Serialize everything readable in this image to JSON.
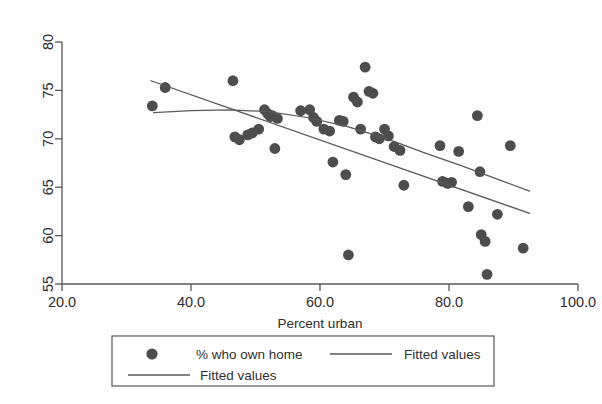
{
  "chart_data": {
    "type": "scatter",
    "title": "",
    "xlabel": "Percent urban",
    "ylabel": "",
    "xlim": [
      20.0,
      100.0
    ],
    "ylim": [
      55,
      80
    ],
    "xticks": [
      "20.0",
      "40.0",
      "60.0",
      "80.0",
      "100.0"
    ],
    "xtick_values": [
      20.0,
      40.0,
      60.0,
      80.0,
      100.0
    ],
    "yticks": [
      "55",
      "60",
      "65",
      "70",
      "75",
      "80"
    ],
    "ytick_values": [
      55,
      60,
      65,
      70,
      75,
      80
    ],
    "grid": false,
    "legend_position": "below-plot",
    "marker_color": "#4d4d4d",
    "line_color": "#5a5a5a",
    "series": [
      {
        "name": "% who own home",
        "kind": "scatter",
        "points": [
          [
            34.0,
            73.4
          ],
          [
            36.0,
            75.3
          ],
          [
            46.5,
            76.0
          ],
          [
            46.8,
            70.2
          ],
          [
            47.5,
            69.9
          ],
          [
            48.8,
            70.4
          ],
          [
            49.5,
            70.6
          ],
          [
            50.5,
            71.0
          ],
          [
            51.4,
            73.0
          ],
          [
            51.9,
            72.6
          ],
          [
            52.3,
            72.3
          ],
          [
            52.6,
            72.4
          ],
          [
            53.4,
            72.1
          ],
          [
            53.0,
            69.0
          ],
          [
            57.0,
            72.9
          ],
          [
            58.4,
            73.0
          ],
          [
            59.0,
            72.2
          ],
          [
            59.5,
            71.8
          ],
          [
            60.6,
            71.0
          ],
          [
            61.5,
            70.8
          ],
          [
            62.0,
            67.6
          ],
          [
            63.0,
            71.9
          ],
          [
            63.6,
            71.8
          ],
          [
            64.0,
            66.3
          ],
          [
            64.4,
            58.0
          ],
          [
            65.2,
            74.3
          ],
          [
            65.8,
            73.8
          ],
          [
            66.3,
            71.0
          ],
          [
            67.0,
            77.4
          ],
          [
            67.6,
            74.9
          ],
          [
            68.2,
            74.7
          ],
          [
            68.6,
            70.2
          ],
          [
            69.2,
            70.0
          ],
          [
            70.0,
            71.0
          ],
          [
            70.6,
            70.3
          ],
          [
            71.5,
            69.2
          ],
          [
            72.4,
            68.8
          ],
          [
            73.0,
            65.2
          ],
          [
            78.6,
            69.3
          ],
          [
            79.0,
            65.6
          ],
          [
            79.8,
            65.4
          ],
          [
            80.4,
            65.5
          ],
          [
            81.5,
            68.7
          ],
          [
            83.0,
            63.0
          ],
          [
            84.4,
            72.4
          ],
          [
            84.8,
            66.6
          ],
          [
            85.0,
            60.1
          ],
          [
            85.6,
            59.4
          ],
          [
            85.9,
            56.0
          ],
          [
            87.5,
            62.2
          ],
          [
            89.5,
            69.3
          ],
          [
            91.5,
            58.7
          ]
        ]
      },
      {
        "name": "Fitted values",
        "kind": "line",
        "style": "linear",
        "points": [
          [
            33.8,
            76.0
          ],
          [
            92.5,
            62.3
          ]
        ]
      },
      {
        "name": "Fitted values",
        "kind": "line",
        "style": "quadratic",
        "points": [
          [
            34.2,
            72.7
          ],
          [
            40.0,
            72.9
          ],
          [
            46.0,
            73.0
          ],
          [
            52.0,
            72.8
          ],
          [
            58.0,
            72.2
          ],
          [
            64.0,
            71.3
          ],
          [
            70.0,
            70.1
          ],
          [
            76.0,
            68.6
          ],
          [
            82.0,
            67.2
          ],
          [
            88.0,
            65.7
          ],
          [
            92.5,
            64.6
          ]
        ]
      }
    ]
  },
  "legend": {
    "entries": [
      {
        "label": "% who own home",
        "symbol": "marker"
      },
      {
        "label": "Fitted values",
        "symbol": "line"
      },
      {
        "label": "Fitted values",
        "symbol": "line"
      }
    ]
  }
}
